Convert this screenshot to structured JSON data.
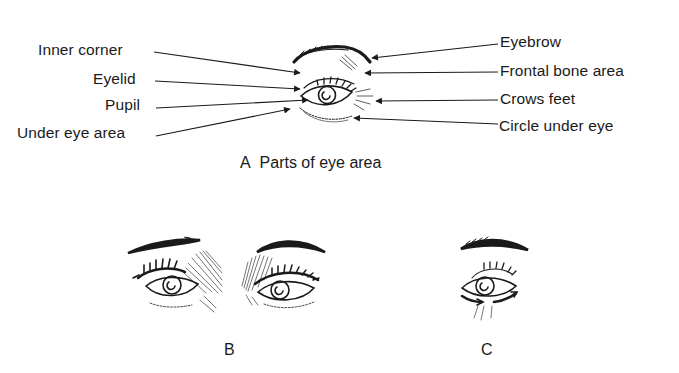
{
  "figure_A": {
    "caption_letter": "A",
    "caption_text": "Parts of eye area",
    "left_labels": [
      "Inner corner",
      "Eyelid",
      "Pupil",
      "Under eye area"
    ],
    "right_labels": [
      "Eyebrow",
      "Frontal bone area",
      "Crows feet",
      "Circle under eye"
    ]
  },
  "figure_B": {
    "caption_letter": "B"
  },
  "figure_C": {
    "caption_letter": "C"
  },
  "colors": {
    "ink": "#1a1a1a",
    "background": "#ffffff"
  }
}
